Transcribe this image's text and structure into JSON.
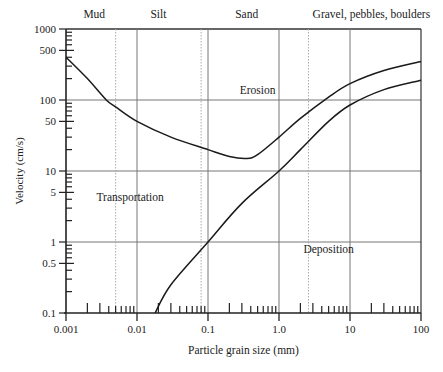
{
  "chart_data": {
    "type": "line",
    "title": "",
    "xlabel": "Particle grain size (mm)",
    "ylabel": "Velocity (cm/s)",
    "xscale": "log",
    "yscale": "log",
    "xlim": [
      0.001,
      100
    ],
    "ylim": [
      0.1,
      1000
    ],
    "x_tick_labels": [
      "0.001",
      "0.01",
      "0.1",
      "1.0",
      "10",
      "100"
    ],
    "y_tick_labels": [
      "0.1",
      "0.5",
      "1",
      "5",
      "10",
      "50",
      "100",
      "500",
      "1000"
    ],
    "grid": true,
    "category_labels": [
      {
        "label": "Mud",
        "x_center": 0.0025
      },
      {
        "label": "Silt",
        "x_center": 0.02
      },
      {
        "label": "Sand",
        "x_center": 0.35
      },
      {
        "label": "Gravel, pebbles, boulders",
        "x_center": 20
      }
    ],
    "category_boundaries_mm": [
      0.005,
      0.08,
      2.6
    ],
    "region_labels": [
      {
        "label": "Erosion",
        "x": 0.5,
        "y": 120
      },
      {
        "label": "Transportation",
        "x": 0.008,
        "y": 3.8
      },
      {
        "label": "Deposition",
        "x": 5,
        "y": 0.7
      }
    ],
    "series": [
      {
        "name": "Erosion velocity (upper curve)",
        "x": [
          0.001,
          0.002,
          0.0037,
          0.005,
          0.01,
          0.03,
          0.1,
          0.2,
          0.35,
          0.5,
          1.0,
          2.0,
          5.0,
          10,
          30,
          100
        ],
        "y": [
          400,
          200,
          100,
          80,
          50,
          30,
          20,
          16,
          15,
          17,
          30,
          55,
          110,
          170,
          260,
          350
        ]
      },
      {
        "name": "Settling velocity (lower curve)",
        "x": [
          0.018,
          0.03,
          0.1,
          0.3,
          1.0,
          2.0,
          5.0,
          10,
          30,
          100
        ],
        "y": [
          0.1,
          0.25,
          1,
          3.5,
          10,
          20,
          50,
          85,
          140,
          190
        ]
      }
    ]
  }
}
